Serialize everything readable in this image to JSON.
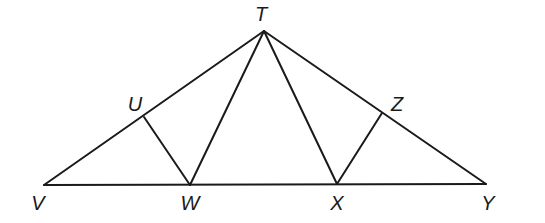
{
  "diagram": {
    "type": "geometry-figure",
    "stroke_color": "#1a1a1a",
    "background": "#ffffff",
    "points": {
      "T": {
        "label": "T",
        "x": 264,
        "y": 31,
        "label_x": 261,
        "label_y": 21
      },
      "U": {
        "label": "U",
        "x": 144,
        "y": 117,
        "label_x": 135,
        "label_y": 111
      },
      "V": {
        "label": "V",
        "x": 44,
        "y": 185,
        "label_x": 38,
        "label_y": 210
      },
      "W": {
        "label": "W",
        "x": 190,
        "y": 185,
        "label_x": 190,
        "label_y": 210
      },
      "X": {
        "label": "X",
        "x": 337,
        "y": 184,
        "label_x": 337,
        "label_y": 210
      },
      "Y": {
        "label": "Y",
        "x": 486,
        "y": 184,
        "label_x": 488,
        "label_y": 210
      },
      "Z": {
        "label": "Z",
        "x": 382,
        "y": 113,
        "label_x": 397,
        "label_y": 111
      }
    },
    "segments": [
      {
        "name": "segment-TV",
        "from": "T",
        "to": "V"
      },
      {
        "name": "segment-TY",
        "from": "T",
        "to": "Y"
      },
      {
        "name": "segment-VY",
        "from": "V",
        "to": "Y"
      },
      {
        "name": "segment-TW",
        "from": "T",
        "to": "W"
      },
      {
        "name": "segment-TX",
        "from": "T",
        "to": "X"
      },
      {
        "name": "segment-UW",
        "from": "U",
        "to": "W"
      },
      {
        "name": "segment-ZX",
        "from": "Z",
        "to": "X"
      }
    ]
  }
}
